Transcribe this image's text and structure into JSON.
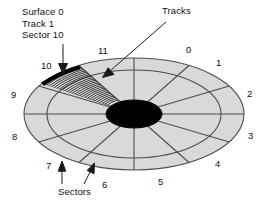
{
  "figure": {
    "type": "disk-platter-geometry-diagram",
    "background_color": "#ffffff",
    "platter_fill": "#d9d9d9",
    "line_color": "#4d4d4d",
    "hub_color": "#000000",
    "highlight_color": "#000000"
  },
  "callouts": {
    "surface": {
      "line1": "Surface 0",
      "line2": "Track 1",
      "line3": "Sector 10"
    },
    "tracks": "Tracks",
    "sectors": "Sectors"
  },
  "sector_labels": [
    {
      "label": "0",
      "x": 186,
      "y": 44
    },
    {
      "label": "1",
      "x": 216,
      "y": 57
    },
    {
      "label": "2",
      "x": 247,
      "y": 88
    },
    {
      "label": "3",
      "x": 248,
      "y": 130
    },
    {
      "label": "4",
      "x": 215,
      "y": 158
    },
    {
      "label": "5",
      "x": 158,
      "y": 176
    },
    {
      "label": "6",
      "x": 102,
      "y": 179
    },
    {
      "label": "7",
      "x": 46,
      "y": 160
    },
    {
      "label": "8",
      "x": 12,
      "y": 131
    },
    {
      "label": "9",
      "x": 11,
      "y": 89
    },
    {
      "label": "10",
      "x": 41,
      "y": 60
    },
    {
      "label": "11",
      "x": 98,
      "y": 45
    }
  ],
  "chart_data": {
    "type": "diagram",
    "geometry": {
      "center_x": 134,
      "center_y": 114,
      "outer_radius_x": 110,
      "outer_radius_y": 56,
      "inner_radius_x": 87,
      "inner_radius_y": 44,
      "hub_radius_x": 28,
      "hub_radius_y": 14
    },
    "sector_count": 12,
    "sector_numbering": [
      "0",
      "1",
      "2",
      "3",
      "4",
      "5",
      "6",
      "7",
      "8",
      "9",
      "10",
      "11"
    ],
    "highlighted_sector": "10",
    "highlighted_track": "1",
    "highlighted_surface": "0",
    "track_hatch_lines": 26,
    "annotations": [
      "Surface 0",
      "Track 1",
      "Sector 10",
      "Tracks",
      "Sectors"
    ]
  }
}
